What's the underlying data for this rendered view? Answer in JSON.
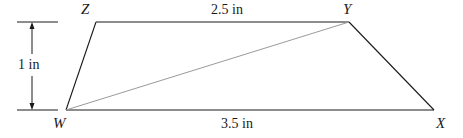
{
  "diagram": {
    "type": "trapezoid",
    "vertices": {
      "W": {
        "label": "W",
        "x": 66,
        "y": 110
      },
      "X": {
        "label": "X",
        "x": 434,
        "y": 110
      },
      "Y": {
        "label": "Y",
        "x": 349,
        "y": 22
      },
      "Z": {
        "label": "Z",
        "x": 96,
        "y": 22
      }
    },
    "edges": [
      {
        "from": "W",
        "to": "X"
      },
      {
        "from": "X",
        "to": "Y"
      },
      {
        "from": "Y",
        "to": "Z"
      },
      {
        "from": "Z",
        "to": "W"
      }
    ],
    "diagonal": {
      "from": "W",
      "to": "Y"
    },
    "measurements": {
      "top": "2.5 in",
      "bottom": "3.5 in",
      "height": "1 in"
    },
    "colors": {
      "stroke": "#1a1a1a",
      "diagonal": "#9a9a9a"
    }
  }
}
